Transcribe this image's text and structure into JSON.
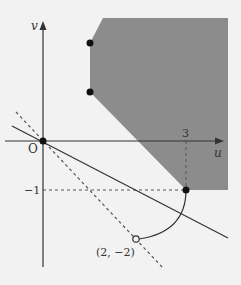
{
  "figure": {
    "background": "#f2f2f2",
    "region_color": "#8c8c8c",
    "line_color": "#333333",
    "axes": {
      "x_label": "u",
      "y_label": "v",
      "origin_label": "O",
      "tick_x_label": "3",
      "tick_y_label": "−1"
    },
    "points": {
      "closed_1_label": "",
      "open_point_label": "(2, −2)"
    }
  }
}
